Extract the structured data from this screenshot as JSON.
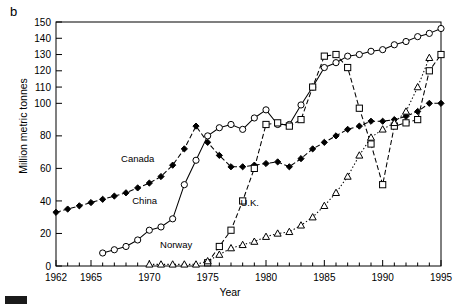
{
  "figure": {
    "panel_label": "b",
    "y_axis_title": "Million metric tonnes",
    "x_axis_title": "Year"
  },
  "chart_data": {
    "type": "line",
    "title": "",
    "xlabel": "Year",
    "ylabel": "Million metric tonnes",
    "xlim": [
      1962,
      1995
    ],
    "ylim": [
      0,
      150
    ],
    "xticks": [
      1962,
      1963,
      1964,
      1965,
      1966,
      1967,
      1968,
      1969,
      1970,
      1971,
      1972,
      1973,
      1974,
      1975,
      1976,
      1977,
      1978,
      1979,
      1980,
      1981,
      1982,
      1983,
      1984,
      1985,
      1986,
      1987,
      1988,
      1989,
      1990,
      1991,
      1992,
      1993,
      1994,
      1995
    ],
    "xtick_labels": [
      "1962",
      "1965",
      "1970",
      "1975",
      "1980",
      "1985",
      "1990",
      "1995"
    ],
    "xtick_label_values": [
      1962,
      1965,
      1970,
      1975,
      1980,
      1985,
      1990,
      1995
    ],
    "yticks": [
      0,
      20,
      40,
      60,
      80,
      100,
      110,
      120,
      130,
      140,
      150
    ],
    "ytick_labels": [
      "0",
      "20",
      "40",
      "60",
      "80",
      "100",
      "110",
      "120",
      "130",
      "140",
      "150"
    ],
    "grid": false,
    "legend": "inline-annotations",
    "series": [
      {
        "name": "Canada",
        "marker": "filled-diamond",
        "line": "dashed",
        "label_x": 1969.0,
        "label_y": 64,
        "x": [
          1962,
          1963,
          1964,
          1965,
          1966,
          1967,
          1968,
          1969,
          1970,
          1971,
          1972,
          1973,
          1974,
          1975,
          1976,
          1977,
          1978,
          1979,
          1980,
          1981,
          1982,
          1983,
          1984,
          1985,
          1986,
          1987,
          1988,
          1989,
          1990,
          1991,
          1992,
          1993,
          1994,
          1995
        ],
        "y": [
          33,
          35,
          37,
          39,
          41,
          43,
          45,
          48,
          51,
          55,
          62,
          72,
          86,
          76,
          68,
          61,
          61,
          62,
          63,
          64,
          61,
          66,
          72,
          76,
          80,
          84,
          86,
          89,
          89,
          90,
          92,
          95,
          100,
          100
        ]
      },
      {
        "name": "China",
        "marker": "open-circle",
        "line": "solid",
        "label_x": 1969.6,
        "label_y": 38,
        "x": [
          1966,
          1967,
          1968,
          1969,
          1970,
          1971,
          1972,
          1973,
          1974,
          1975,
          1976,
          1977,
          1978,
          1979,
          1980,
          1981,
          1982,
          1983,
          1984,
          1985,
          1986,
          1987,
          1988,
          1989,
          1990,
          1991,
          1992,
          1993,
          1994,
          1995
        ],
        "y": [
          8,
          10,
          12,
          16,
          22,
          24,
          29,
          50,
          65,
          80,
          85,
          87,
          84,
          91,
          96,
          87,
          87,
          99,
          110,
          122,
          125,
          129,
          130,
          132,
          133,
          136,
          138,
          141,
          143,
          146
        ]
      },
      {
        "name": "U.K.",
        "marker": "open-square",
        "line": "dashed",
        "label_x": 1978.6,
        "label_y": 37,
        "x": [
          1975,
          1976,
          1977,
          1978,
          1979,
          1980,
          1981,
          1982,
          1983,
          1984,
          1985,
          1986,
          1987,
          1988,
          1989,
          1990,
          1991,
          1992,
          1993,
          1994,
          1995
        ],
        "y": [
          2,
          12,
          22,
          40,
          60,
          87,
          88,
          86,
          90,
          110,
          129,
          130,
          122,
          97,
          75,
          50,
          86,
          88,
          90,
          120,
          130
        ]
      },
      {
        "name": "Norway",
        "marker": "open-triangle",
        "line": "dotted",
        "label_x": 1972.3,
        "label_y": 11,
        "x": [
          1970,
          1971,
          1972,
          1973,
          1974,
          1975,
          1976,
          1977,
          1978,
          1979,
          1980,
          1981,
          1982,
          1983,
          1984,
          1985,
          1986,
          1987,
          1988,
          1989,
          1990,
          1991,
          1992,
          1993,
          1994
        ],
        "y": [
          1,
          1,
          1,
          1,
          1,
          3,
          7,
          11,
          13,
          15,
          18,
          20,
          21,
          25,
          30,
          37,
          45,
          55,
          68,
          79,
          84,
          88,
          95,
          110,
          128
        ]
      }
    ]
  }
}
